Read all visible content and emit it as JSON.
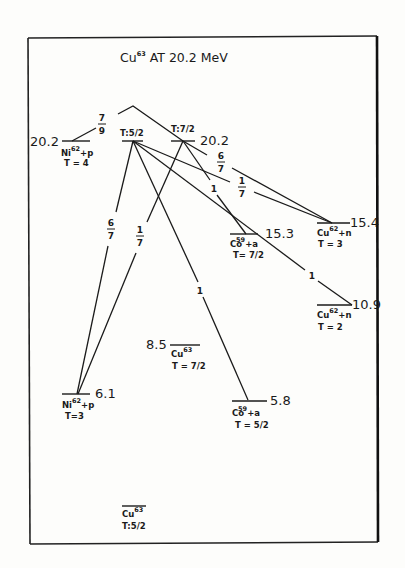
{
  "title": {
    "nucleus": "Cu",
    "mass": "63",
    "rest": "AT  20.2 MeV"
  },
  "levels": {
    "ni62p_t4": {
      "energy": "20.2",
      "nucleus": "Ni",
      "mass": "62",
      "suffix": "+p",
      "isospin": "T = 4"
    },
    "cu63_t52_top": {
      "isospin": "T:5/2"
    },
    "cu63_t72_top": {
      "isospin": "T:7/2",
      "energy": "20.2"
    },
    "co59a_t72": {
      "energy": "15.3",
      "nucleus": "Co",
      "mass": "59",
      "suffix": "+a",
      "isospin": "T= 7/2"
    },
    "cu62n_t3": {
      "energy": "15.4",
      "nucleus": "Cu",
      "mass": "62",
      "suffix": "+n",
      "isospin": "T = 3"
    },
    "cu62n_t2": {
      "energy": "10.9",
      "nucleus": "Cu",
      "mass": "62",
      "suffix": "+n",
      "isospin": "T = 2"
    },
    "cu63_t72": {
      "energy": "8.5",
      "nucleus": "Cu",
      "mass": "63",
      "isospin": "T = 7/2"
    },
    "ni62p_t3": {
      "energy": "6.1",
      "nucleus": "Ni",
      "mass": "62",
      "suffix": "+p",
      "isospin": "T=3"
    },
    "co59a_t52": {
      "energy": "5.8",
      "nucleus": "Co",
      "mass": "59",
      "suffix": "+a",
      "isospin": "T = 5/2"
    },
    "cu63_ground": {
      "nucleus": "Cu",
      "mass": "63",
      "isospin": "T:5/2"
    }
  },
  "transitions": [
    {
      "from": "ni62p_t4",
      "to": "cu63_t72_top",
      "label_num": "7",
      "label_den": "9"
    },
    {
      "from": "cu63_t52_top",
      "to": "ni62p_t3",
      "label_num": "6",
      "label_den": "7"
    },
    {
      "from": "cu63_t72_top",
      "to": "ni62p_t3",
      "label_num": "1",
      "label_den": "7"
    },
    {
      "from": "cu63_t52_top",
      "to": "co59a_t52",
      "label": "1"
    },
    {
      "from": "cu63_t72_top",
      "to": "co59a_t72",
      "label": "1"
    },
    {
      "from": "cu63_t72_top",
      "to": "cu62n_t3",
      "label_num": "6",
      "label_den": "7"
    },
    {
      "from": "cu63_t52_top",
      "to": "cu62n_t3",
      "label_num": "1",
      "label_den": "7"
    },
    {
      "from": "cu63_t52_top",
      "to": "cu62n_t2",
      "label": "1"
    }
  ]
}
